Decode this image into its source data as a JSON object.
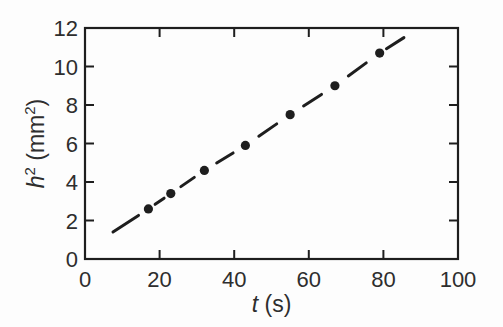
{
  "figure": {
    "background": "#fdfdfd",
    "ink_color": "#1e1e1e",
    "label_color": "#2e2e2e"
  },
  "chart_data": {
    "type": "scatter",
    "title": "",
    "xlabel": "t (s)",
    "ylabel": "h^2 (mm^2)",
    "xlabel_segments": [
      {
        "text": "t",
        "italic": true
      },
      {
        "text": " (s)"
      }
    ],
    "ylabel_segments": [
      {
        "text": "h",
        "italic": true
      },
      {
        "text": "2",
        "sup": true
      },
      {
        "text": " (mm"
      },
      {
        "text": "2",
        "sup": true
      },
      {
        "text": ")"
      }
    ],
    "x": [
      17,
      23,
      32,
      43,
      55,
      67,
      79
    ],
    "y": [
      2.6,
      3.4,
      4.6,
      5.9,
      7.5,
      9.0,
      10.7
    ],
    "fit_line": {
      "style": "dashed",
      "x_start": 7.5,
      "y_start": 1.4,
      "x_end": 85.5,
      "y_end": 11.5
    },
    "xlim": [
      0,
      100
    ],
    "ylim": [
      0,
      12
    ],
    "xticks": [
      0,
      20,
      40,
      60,
      80,
      100
    ],
    "yticks": [
      0,
      2,
      4,
      6,
      8,
      10,
      12
    ],
    "grid": false,
    "legend": "none",
    "frame": "box",
    "tick_direction": "in",
    "marker": "filled-circle"
  }
}
